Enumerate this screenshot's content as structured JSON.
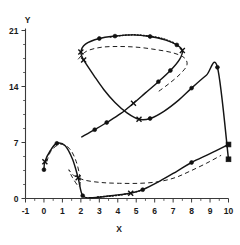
{
  "chart_data": {
    "type": "line",
    "title": "",
    "xlabel": "X",
    "ylabel": "Y",
    "xlim": [
      -1,
      10
    ],
    "ylim": [
      0,
      21
    ],
    "grid": false,
    "legend": "none",
    "xticks": [
      -1,
      0,
      1,
      2,
      3,
      4,
      5,
      6,
      7,
      8,
      9,
      10
    ],
    "xticklabels": [
      "-1",
      "0",
      "1",
      "2",
      "3",
      "4",
      "5",
      "6",
      "7",
      "8",
      "9",
      "10"
    ],
    "yticks": [
      0,
      7,
      14,
      21
    ],
    "yticklabels": [
      "0",
      "7",
      "14",
      "21"
    ],
    "xminor_step": 0.5,
    "yminor_step": 1.75,
    "series": [
      {
        "name": "solid-figure-eight",
        "style": "solid",
        "points": [
          [
            0.0,
            3.6
          ],
          [
            0.05,
            4.6
          ],
          [
            0.35,
            6.0
          ],
          [
            0.7,
            6.9
          ],
          [
            1.15,
            6.6
          ],
          [
            1.55,
            4.9
          ],
          [
            1.85,
            2.6
          ],
          [
            2.1,
            0.35
          ],
          [
            2.6,
            0.1
          ],
          [
            3.3,
            0.25
          ],
          [
            4.0,
            0.45
          ],
          [
            4.7,
            0.65
          ],
          [
            5.35,
            1.1
          ],
          [
            6.3,
            2.2
          ],
          [
            7.2,
            3.4
          ],
          [
            8.0,
            4.5
          ],
          [
            9.0,
            5.6
          ],
          [
            10.0,
            6.75
          ]
        ]
      },
      {
        "name": "solid-upper-lobe",
        "style": "solid",
        "points": [
          [
            2.15,
            17.3
          ],
          [
            2.0,
            18.3
          ],
          [
            2.25,
            19.3
          ],
          [
            3.0,
            20.0
          ],
          [
            3.85,
            20.3
          ],
          [
            4.8,
            20.45
          ],
          [
            5.75,
            20.25
          ],
          [
            6.6,
            19.8
          ],
          [
            7.2,
            19.2
          ],
          [
            7.5,
            18.5
          ],
          [
            7.35,
            17.4
          ],
          [
            6.85,
            16.0
          ],
          [
            6.2,
            14.6
          ],
          [
            5.5,
            13.2
          ],
          [
            4.85,
            11.9
          ],
          [
            4.15,
            10.6
          ],
          [
            3.4,
            9.5
          ],
          [
            2.75,
            8.6
          ],
          [
            2.05,
            7.7
          ]
        ]
      },
      {
        "name": "solid-rising-diagonal",
        "style": "solid",
        "points": [
          [
            2.15,
            17.3
          ],
          [
            2.7,
            15.4
          ],
          [
            3.25,
            13.6
          ],
          [
            3.85,
            12.0
          ],
          [
            4.5,
            10.7
          ],
          [
            5.15,
            9.9
          ],
          [
            5.75,
            10.0
          ],
          [
            6.5,
            10.9
          ],
          [
            7.3,
            12.3
          ],
          [
            8.0,
            13.8
          ],
          [
            8.8,
            15.4
          ],
          [
            9.4,
            16.4
          ],
          [
            10.0,
            4.9
          ]
        ]
      },
      {
        "name": "dashed-upper-lobe",
        "style": "dashed",
        "points": [
          [
            1.85,
            17.4
          ],
          [
            2.3,
            18.4
          ],
          [
            3.1,
            18.9
          ],
          [
            4.1,
            19.0
          ],
          [
            5.1,
            18.9
          ],
          [
            6.1,
            18.6
          ],
          [
            7.0,
            18.2
          ],
          [
            7.6,
            17.6
          ],
          [
            7.75,
            16.7
          ],
          [
            7.4,
            15.6
          ],
          [
            6.8,
            14.4
          ],
          [
            6.1,
            13.2
          ]
        ]
      },
      {
        "name": "dashed-lower-lobe",
        "style": "dashed",
        "points": [
          [
            0.15,
            4.6
          ],
          [
            0.4,
            6.0
          ],
          [
            0.9,
            6.8
          ],
          [
            1.4,
            6.2
          ],
          [
            1.75,
            4.6
          ],
          [
            1.95,
            2.6
          ],
          [
            1.9,
            1.5
          ],
          [
            1.55,
            2.6
          ],
          [
            1.35,
            3.6
          ],
          [
            1.6,
            2.9
          ],
          [
            2.2,
            2.3
          ],
          [
            3.1,
            2.0
          ],
          [
            4.1,
            1.9
          ],
          [
            5.2,
            1.9
          ],
          [
            6.2,
            2.1
          ],
          [
            7.1,
            2.6
          ],
          [
            7.9,
            3.4
          ],
          [
            8.8,
            4.4
          ],
          [
            9.6,
            5.4
          ]
        ]
      },
      {
        "name": "dotted-upper-crest",
        "style": "dotted",
        "points": [
          [
            3.6,
            20.2
          ],
          [
            4.3,
            20.4
          ],
          [
            5.0,
            20.45
          ],
          [
            5.7,
            20.3
          ],
          [
            6.4,
            20.0
          ],
          [
            7.0,
            19.5
          ]
        ]
      },
      {
        "name": "dotted-lower-trough",
        "style": "dotted",
        "points": [
          [
            2.9,
            0.2
          ],
          [
            3.6,
            0.3
          ],
          [
            4.3,
            0.5
          ],
          [
            4.9,
            0.8
          ],
          [
            5.35,
            1.05
          ]
        ]
      }
    ],
    "markers": {
      "circle": [
        [
          0.0,
          3.6
        ],
        [
          0.7,
          6.9
        ],
        [
          2.1,
          0.35
        ],
        [
          3.0,
          20.0
        ],
        [
          3.85,
          20.3
        ],
        [
          5.75,
          20.25
        ],
        [
          7.2,
          19.2
        ],
        [
          6.85,
          16.0
        ],
        [
          6.2,
          14.6
        ],
        [
          2.75,
          8.6
        ],
        [
          3.4,
          9.5
        ],
        [
          5.75,
          10.0
        ],
        [
          8.0,
          13.8
        ],
        [
          9.4,
          16.4
        ],
        [
          8.0,
          4.5
        ],
        [
          5.35,
          1.1
        ]
      ],
      "cross": [
        [
          0.05,
          4.6
        ],
        [
          2.15,
          17.3
        ],
        [
          7.5,
          18.5
        ],
        [
          4.85,
          11.9
        ],
        [
          1.85,
          2.6
        ],
        [
          4.7,
          0.65
        ],
        [
          2.0,
          18.3
        ],
        [
          5.15,
          9.9
        ]
      ],
      "square": [
        [
          10.0,
          6.75
        ],
        [
          10.0,
          4.9
        ]
      ]
    }
  },
  "axes": {
    "y_title": "Y",
    "x_title": "X"
  }
}
